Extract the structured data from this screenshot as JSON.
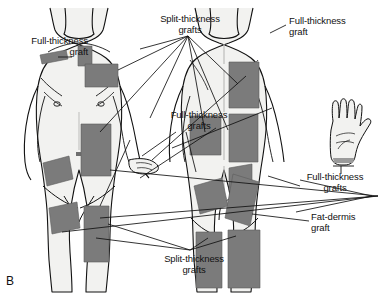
{
  "figure": {
    "panel_letter": "B",
    "background_color": "#ffffff",
    "ink_color": "#111111",
    "skin_fill": "#f2f2f0",
    "skin_shade": "#e2e2e0",
    "graft_fill": "#7b7b7b",
    "graft_stroke": "#5c5c5c",
    "leader_color": "#111111"
  },
  "labels": [
    {
      "id": "full-thickness-graft-left",
      "text": "Full-thickness\ngraft",
      "align": "right",
      "x": 2,
      "y": 36,
      "width": 86
    },
    {
      "id": "split-thickness-grafts-top",
      "text": "Split-thickness\ngrafts",
      "align": "center",
      "x": 148,
      "y": 14,
      "width": 84
    },
    {
      "id": "full-thickness-graft-right",
      "text": "Full-thickness\ngraft",
      "align": "left",
      "x": 289,
      "y": 16,
      "width": 86
    },
    {
      "id": "full-thickness-grafts-center",
      "text": "Full-thickness\ngrafts",
      "align": "center",
      "x": 157,
      "y": 110,
      "width": 84
    },
    {
      "id": "full-thickness-grafts-right",
      "text": "Full-thickness\ngrafts",
      "align": "center",
      "x": 293,
      "y": 172,
      "width": 84
    },
    {
      "id": "fat-dermis-graft",
      "text": "Fat-dermis\ngraft",
      "align": "left",
      "x": 311,
      "y": 212,
      "width": 68
    },
    {
      "id": "split-thickness-grafts-bottom",
      "text": "Split-thickness\ngrafts",
      "align": "center",
      "x": 152,
      "y": 254,
      "width": 84
    }
  ],
  "anatomy": {
    "anterior_figure_name": "anterior-body-figure",
    "posterior_figure_name": "posterior-body-figure",
    "hand_figure_name": "hand-figure"
  },
  "graft_sites": {
    "anterior": [
      {
        "name": "graft-anterior-shoulder-left",
        "type": "full-thickness"
      },
      {
        "name": "graft-anterior-supraclavicular",
        "type": "split-thickness"
      },
      {
        "name": "graft-anterior-upper-chest",
        "type": "split-thickness"
      },
      {
        "name": "graft-anterior-abdomen",
        "type": "split-thickness"
      },
      {
        "name": "graft-anterior-flank",
        "type": "full-thickness"
      },
      {
        "name": "graft-anterior-groin",
        "type": "full-thickness"
      },
      {
        "name": "graft-anterior-thigh",
        "type": "split-thickness"
      }
    ],
    "posterior": [
      {
        "name": "graft-posterior-upper-back",
        "type": "split-thickness"
      },
      {
        "name": "graft-posterior-scapula",
        "type": "split-thickness"
      },
      {
        "name": "graft-posterior-mid-back",
        "type": "split-thickness"
      },
      {
        "name": "graft-posterior-lower-back",
        "type": "split-thickness"
      },
      {
        "name": "graft-posterior-buttock-left",
        "type": "fat-dermis"
      },
      {
        "name": "graft-posterior-buttock-right",
        "type": "fat-dermis"
      },
      {
        "name": "graft-posterior-thigh-left",
        "type": "split-thickness"
      },
      {
        "name": "graft-posterior-thigh-right",
        "type": "split-thickness"
      }
    ]
  }
}
